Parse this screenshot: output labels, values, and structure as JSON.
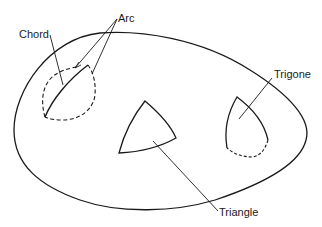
{
  "diagram": {
    "labels": {
      "arc": "Arc",
      "chord": "Chord",
      "trigone": "Trigone",
      "triangle": "Triangle"
    },
    "colors": {
      "stroke": "#1a1a1a",
      "background": "#ffffff"
    },
    "shapes": [
      {
        "name": "outer-surface",
        "style": "solid"
      },
      {
        "name": "chord-region",
        "style": "dashed with solid chord"
      },
      {
        "name": "triangle",
        "style": "solid"
      },
      {
        "name": "trigone",
        "style": "solid with dashed base"
      }
    ]
  }
}
